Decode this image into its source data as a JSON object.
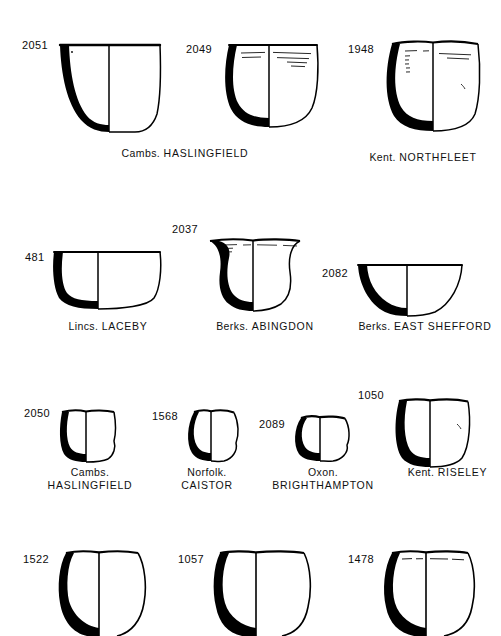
{
  "figure": {
    "type": "archaeological-pottery-profile-plate",
    "background_color": "#ffffff",
    "ink_color": "#000000",
    "rows": 4,
    "vessel_count": 13
  },
  "vessels": [
    {
      "catalogue_number": "2051",
      "county": "Cambs.",
      "site": "HASLINGFIELD",
      "caption_lines": 1,
      "form": "deep bowl with slightly flaring rim and rounded base",
      "decoration": "none"
    },
    {
      "catalogue_number": "2049",
      "county": "Cambs.",
      "site": "HASLINGFIELD",
      "caption_lines": 1,
      "form": "deep rounded bowl with everted rim",
      "decoration": "horizontal incised lines below rim"
    },
    {
      "catalogue_number": "1948",
      "county": "Kent.",
      "site": "NORTHFLEET",
      "caption_lines": 1,
      "form": "deep bucket-shaped vessel with upright rim",
      "decoration": "horizontal lines and short vertical strokes below rim"
    },
    {
      "catalogue_number": "481",
      "county": "Lincs.",
      "site": "LACEBY",
      "caption_lines": 1,
      "form": "wide shallow bowl with flat base",
      "decoration": "none"
    },
    {
      "catalogue_number": "2037",
      "county": "Berks.",
      "site": "ABINGDON",
      "caption_lines": 1,
      "form": "bowl with strongly everted flaring rim",
      "decoration": "horizontal incised lines at rim"
    },
    {
      "catalogue_number": "2082",
      "county": "Berks.",
      "site": "EAST SHEFFORD",
      "caption_lines": 1,
      "form": "hemispherical open bowl",
      "decoration": "none"
    },
    {
      "catalogue_number": "2050",
      "county": "Cambs.",
      "site": "HASLINGFIELD",
      "caption_lines": 2,
      "form": "small straight-sided cup",
      "decoration": "none"
    },
    {
      "catalogue_number": "1568",
      "county": "Norfolk.",
      "site": "CAISTOR",
      "caption_lines": 2,
      "form": "small globular cup",
      "decoration": "none"
    },
    {
      "catalogue_number": "2089",
      "county": "Oxon.",
      "site": "BRIGHTHAMPTON",
      "caption_lines": 2,
      "form": "small squat rounded cup",
      "decoration": "none"
    },
    {
      "catalogue_number": "1050",
      "county": "Kent.",
      "site": "RISELEY",
      "caption_lines": 1,
      "form": "deep rounded bowl with slight rim",
      "decoration": "none"
    },
    {
      "catalogue_number": "1522",
      "county": "",
      "site": "",
      "caption_lines": 0,
      "form": "globular jar with upright rim, drawing cropped at lower edge of plate",
      "decoration": "none"
    },
    {
      "catalogue_number": "1057",
      "county": "",
      "site": "",
      "caption_lines": 0,
      "form": "wide globular jar with short rim, drawing cropped at lower edge of plate",
      "decoration": "none"
    },
    {
      "catalogue_number": "1478",
      "county": "",
      "site": "",
      "caption_lines": 0,
      "form": "globular jar with narrow rim, drawing cropped at lower edge of plate",
      "decoration": "horizontal incised lines below rim"
    }
  ]
}
